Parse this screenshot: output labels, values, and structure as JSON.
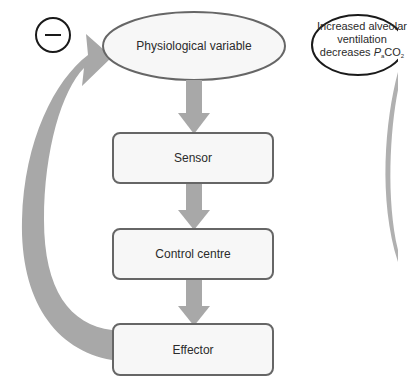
{
  "diagram": {
    "feedback_sign": "−",
    "variable_label": "Physiological variable",
    "boxes": [
      {
        "id": "sensor",
        "label": "Sensor"
      },
      {
        "id": "control",
        "label": "Control centre"
      },
      {
        "id": "effector",
        "label": "Effector"
      }
    ],
    "callout": {
      "line1": "Increased alveolar",
      "line2": "ventilation",
      "line3_prefix": "decreases ",
      "line3_italic": "P",
      "line3_sub": "a",
      "line3_suffix": "CO",
      "line3_sub2": "2"
    },
    "colors": {
      "arrow": "#a8a8a8",
      "box_border": "#666666",
      "box_fill": "#f7f7f7",
      "outline": "#1a1a1a"
    }
  }
}
